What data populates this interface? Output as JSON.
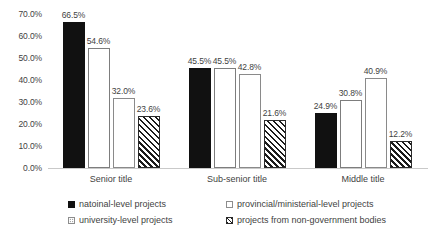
{
  "chart_data": {
    "type": "bar",
    "title": "",
    "subtitle": "",
    "xlabel": "",
    "ylabel": "",
    "categories": [
      "Senior title",
      "Sub-senior title",
      "Middle title"
    ],
    "series": [
      {
        "name": "natoinal-level projects",
        "pattern": "solid-black",
        "values": [
          66.5,
          45.5,
          24.9
        ]
      },
      {
        "name": "provincial/ministerial-level projects",
        "pattern": "hollow-white",
        "values": [
          54.6,
          45.5,
          30.8
        ]
      },
      {
        "name": "university-level projects",
        "pattern": "dotted",
        "values": [
          32.0,
          42.8,
          40.9
        ]
      },
      {
        "name": "projects from non-government bodies",
        "pattern": "diagonal-hatch",
        "values": [
          23.6,
          21.6,
          12.2
        ]
      }
    ],
    "value_labels": [
      [
        "66.5%",
        "54.6%",
        "32.0%",
        "23.6%"
      ],
      [
        "45.5%",
        "45.5%",
        "42.8%",
        "21.6%"
      ],
      [
        "24.9%",
        "30.8%",
        "40.9%",
        "12.2%"
      ]
    ],
    "ylim": [
      0,
      70
    ],
    "ytick_step": 10,
    "ytick_labels": [
      "70.0%",
      "60.0%",
      "50.0%",
      "40.0%",
      "30.0%",
      "20.0%",
      "10.0%",
      "0.0%"
    ],
    "ytick_values": [
      70,
      60,
      50,
      40,
      30,
      20,
      10,
      0
    ],
    "grid": false,
    "legend_position": "bottom",
    "axis_line_color": "#c9c9c9",
    "text_color": "#3f3f3f",
    "background": "#ffffff"
  }
}
